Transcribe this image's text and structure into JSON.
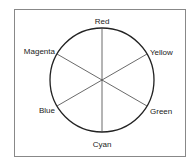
{
  "diagram": {
    "type": "color-wheel",
    "labels": {
      "top": "Red",
      "upper_right": "Yellow",
      "lower_right": "Green",
      "bottom": "Cyan",
      "lower_left": "Blue",
      "upper_left": "Magenta"
    },
    "colors": {
      "frame": "#888888",
      "stroke": "#222222",
      "background": "#ffffff"
    }
  }
}
